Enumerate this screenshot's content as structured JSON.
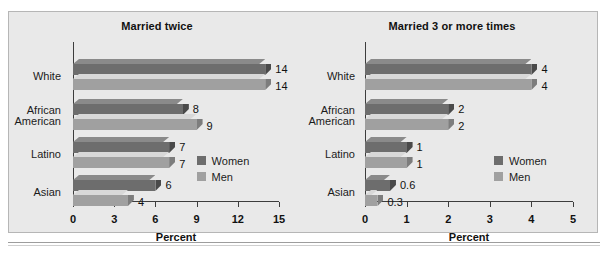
{
  "figure": {
    "axis_label": "Percent",
    "legend": {
      "women": "Women",
      "men": "Men"
    }
  },
  "chart_data": [
    {
      "type": "bar",
      "orientation": "horizontal",
      "title": "Married twice",
      "xlabel": "Percent",
      "ylabel": "",
      "xlim": [
        0,
        15
      ],
      "xticks": [
        0,
        3,
        6,
        9,
        12,
        15
      ],
      "grid": false,
      "legend_position": "inside-right",
      "categories": [
        "White",
        "African\nAmerican",
        "Latino",
        "Asian"
      ],
      "series": [
        {
          "name": "Women",
          "values": [
            14,
            8,
            7,
            6
          ],
          "labels": [
            "14",
            "8",
            "7",
            "6"
          ],
          "color": "#6d6d6d"
        },
        {
          "name": "Men",
          "values": [
            14,
            9,
            7,
            4
          ],
          "labels": [
            "14",
            "9",
            "7",
            "4"
          ],
          "color": "#a0a0a0"
        }
      ]
    },
    {
      "type": "bar",
      "orientation": "horizontal",
      "title": "Married 3 or more times",
      "xlabel": "Percent",
      "ylabel": "",
      "xlim": [
        0,
        5
      ],
      "xticks": [
        0,
        1,
        2,
        3,
        4,
        5
      ],
      "grid": false,
      "legend_position": "inside-right",
      "categories": [
        "White",
        "African\nAmerican",
        "Latino",
        "Asian"
      ],
      "series": [
        {
          "name": "Women",
          "values": [
            4,
            2,
            1,
            0.6
          ],
          "labels": [
            "4",
            "2",
            "1",
            "0.6"
          ],
          "color": "#6d6d6d"
        },
        {
          "name": "Men",
          "values": [
            4,
            2,
            1,
            0.3
          ],
          "labels": [
            "4",
            "2",
            "1",
            "0.3"
          ],
          "color": "#a0a0a0"
        }
      ]
    }
  ]
}
